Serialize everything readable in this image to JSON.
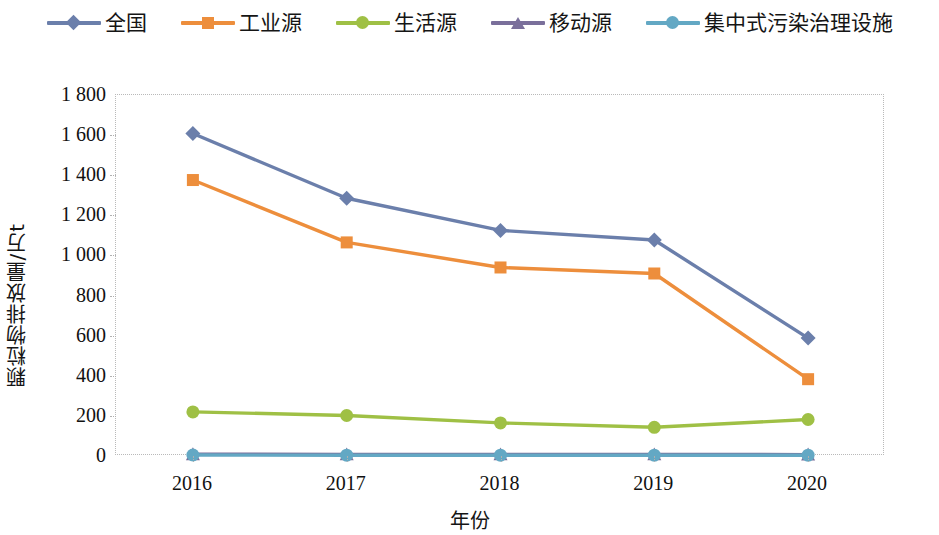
{
  "legend": {
    "position": "top-center",
    "items": [
      {
        "label": "全国",
        "color": "#6b7fab",
        "marker": "diamond",
        "marker_name": "legend-marker-diamond-icon"
      },
      {
        "label": "工业源",
        "color": "#ed8e3c",
        "marker": "square",
        "marker_name": "legend-marker-square-icon"
      },
      {
        "label": "生活源",
        "color": "#9fc045",
        "marker": "circle",
        "marker_name": "legend-marker-circle-icon"
      },
      {
        "label": "移动源",
        "color": "#7a6f9b",
        "marker": "triangle",
        "marker_name": "legend-marker-triangle-icon"
      },
      {
        "label": "集中式污染治理设施",
        "color": "#63a8c4",
        "marker": "circle",
        "marker_name": "legend-marker-circle-icon"
      }
    ]
  },
  "axes": {
    "y_title": "颗粒物排放量/万t",
    "x_title": "年份",
    "y_ticks": [
      "1 800",
      "1 600",
      "1 400",
      "1 200",
      "1 000",
      "800",
      "600",
      "400",
      "200",
      "0"
    ],
    "x_ticks": [
      "2016",
      "2017",
      "2018",
      "2019",
      "2020"
    ]
  },
  "chart_data": {
    "type": "line",
    "title": "",
    "xlabel": "年份",
    "ylabel": "颗粒物排放量/万t",
    "categories": [
      "2016",
      "2017",
      "2018",
      "2019",
      "2020"
    ],
    "x": [
      2016,
      2017,
      2018,
      2019,
      2020
    ],
    "ylim": [
      0,
      1800
    ],
    "ytick_step": 200,
    "grid": false,
    "legend_position": "top-center",
    "series": [
      {
        "name": "全国",
        "color": "#6b7fab",
        "marker": "diamond",
        "values": [
          1608,
          1285,
          1125,
          1077,
          588
        ]
      },
      {
        "name": "工业源",
        "color": "#ed8e3c",
        "marker": "square",
        "values": [
          1376,
          1065,
          940,
          910,
          383
        ]
      },
      {
        "name": "生活源",
        "color": "#9fc045",
        "marker": "circle",
        "values": [
          220,
          202,
          165,
          143,
          182
        ]
      },
      {
        "name": "移动源",
        "color": "#7a6f9b",
        "marker": "triangle",
        "values": [
          9,
          8,
          8,
          8,
          7
        ]
      },
      {
        "name": "集中式污染治理设施",
        "color": "#63a8c4",
        "marker": "circle",
        "values": [
          5,
          4,
          4,
          4,
          4
        ]
      }
    ]
  }
}
